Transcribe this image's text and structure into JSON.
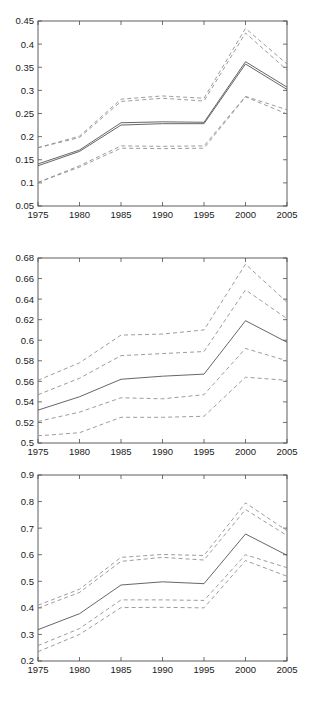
{
  "figure": {
    "background": "#ffffff",
    "panel_count": 3,
    "solid_color": "#4a4a4a",
    "dashed_color": "#8a8a8a",
    "axis_color": "#4d4d4d"
  },
  "chart_data": [
    {
      "type": "line",
      "title": "",
      "xlabel": "",
      "ylabel": "",
      "x": [
        1975,
        1980,
        1985,
        1990,
        1995,
        2000,
        2005
      ],
      "xlim": [
        1975,
        2005
      ],
      "ylim": [
        0.05,
        0.45
      ],
      "xticks": [
        1975,
        1980,
        1985,
        1990,
        1995,
        2000,
        2005
      ],
      "xticklabels": [
        "1975",
        "1980",
        "1985",
        "1990",
        "1995",
        "2000",
        "2005"
      ],
      "yticks": [
        0.05,
        0.1,
        0.15,
        0.2,
        0.25,
        0.3,
        0.35,
        0.4,
        0.45
      ],
      "yticklabels": [
        "0.05",
        "0.1",
        "0.15",
        "0.2",
        "0.25",
        "0.3",
        "0.35",
        "0.4",
        "0.45"
      ],
      "grid": false,
      "legend": "none",
      "series": [
        {
          "name": "upper-outer",
          "style": "dashed",
          "values": [
            0.176,
            0.201,
            0.281,
            0.288,
            0.283,
            0.434,
            0.357
          ]
        },
        {
          "name": "upper-inner",
          "style": "dashed",
          "values": [
            0.176,
            0.198,
            0.276,
            0.283,
            0.277,
            0.424,
            0.344
          ]
        },
        {
          "name": "mean-upper",
          "style": "solid",
          "values": [
            0.141,
            0.171,
            0.23,
            0.232,
            0.231,
            0.362,
            0.307
          ]
        },
        {
          "name": "mean",
          "style": "solid",
          "values": [
            0.137,
            0.168,
            0.225,
            0.228,
            0.228,
            0.357,
            0.302
          ]
        },
        {
          "name": "lower-inner",
          "style": "dashed",
          "values": [
            0.101,
            0.137,
            0.18,
            0.179,
            0.18,
            0.287,
            0.258
          ]
        },
        {
          "name": "lower-outer",
          "style": "dashed",
          "values": [
            0.101,
            0.134,
            0.175,
            0.174,
            0.175,
            0.286,
            0.249
          ]
        }
      ]
    },
    {
      "type": "line",
      "title": "",
      "xlabel": "",
      "ylabel": "",
      "x": [
        1975,
        1980,
        1985,
        1990,
        1995,
        2000,
        2005
      ],
      "xlim": [
        1975,
        2005
      ],
      "ylim": [
        0.5,
        0.68
      ],
      "xticks": [
        1975,
        1980,
        1985,
        1990,
        1995,
        2000,
        2005
      ],
      "xticklabels": [
        "1975",
        "1980",
        "1985",
        "1990",
        "1995",
        "2000",
        "2005"
      ],
      "yticks": [
        0.5,
        0.52,
        0.54,
        0.56,
        0.58,
        0.6,
        0.62,
        0.64,
        0.66,
        0.68
      ],
      "yticklabels": [
        "0.5",
        "0.52",
        "0.54",
        "0.56",
        "0.58",
        "0.6",
        "0.62",
        "0.64",
        "0.66",
        "0.68"
      ],
      "grid": false,
      "legend": "none",
      "series": [
        {
          "name": "upper-outer",
          "style": "dashed",
          "values": [
            0.561,
            0.578,
            0.605,
            0.606,
            0.61,
            0.674,
            0.637
          ]
        },
        {
          "name": "upper-inner",
          "style": "dashed",
          "values": [
            0.547,
            0.563,
            0.585,
            0.587,
            0.589,
            0.649,
            0.621
          ]
        },
        {
          "name": "mean",
          "style": "solid",
          "values": [
            0.532,
            0.545,
            0.562,
            0.565,
            0.567,
            0.619,
            0.598
          ]
        },
        {
          "name": "lower-inner",
          "style": "dashed",
          "values": [
            0.521,
            0.53,
            0.544,
            0.543,
            0.547,
            0.592,
            0.58
          ]
        },
        {
          "name": "lower-outer",
          "style": "dashed",
          "values": [
            0.507,
            0.51,
            0.525,
            0.525,
            0.526,
            0.564,
            0.561
          ]
        }
      ]
    },
    {
      "type": "line",
      "title": "",
      "xlabel": "",
      "ylabel": "",
      "x": [
        1975,
        1980,
        1985,
        1990,
        1995,
        2000,
        2005
      ],
      "xlim": [
        1975,
        2005
      ],
      "ylim": [
        0.2,
        0.9
      ],
      "xticks": [
        1975,
        1980,
        1985,
        1990,
        1995,
        2000,
        2005
      ],
      "xticklabels": [
        "1975",
        "1980",
        "1985",
        "1990",
        "1995",
        "2000",
        "2005"
      ],
      "yticks": [
        0.2,
        0.3,
        0.4,
        0.5,
        0.6,
        0.7,
        0.8,
        0.9
      ],
      "yticklabels": [
        "0.2",
        "0.3",
        "0.4",
        "0.5",
        "0.6",
        "0.7",
        "0.8",
        "0.9"
      ],
      "grid": false,
      "legend": "none",
      "series": [
        {
          "name": "upper-outer",
          "style": "dashed",
          "values": [
            0.41,
            0.47,
            0.59,
            0.601,
            0.597,
            0.795,
            0.69
          ]
        },
        {
          "name": "upper-inner",
          "style": "dashed",
          "values": [
            0.399,
            0.458,
            0.575,
            0.59,
            0.58,
            0.77,
            0.672
          ]
        },
        {
          "name": "mean",
          "style": "solid",
          "values": [
            0.318,
            0.378,
            0.486,
            0.498,
            0.491,
            0.678,
            0.598
          ]
        },
        {
          "name": "lower-inner",
          "style": "dashed",
          "values": [
            0.258,
            0.322,
            0.43,
            0.43,
            0.428,
            0.6,
            0.551
          ]
        },
        {
          "name": "lower-outer",
          "style": "dashed",
          "values": [
            0.235,
            0.3,
            0.401,
            0.402,
            0.4,
            0.578,
            0.519
          ]
        }
      ]
    }
  ]
}
